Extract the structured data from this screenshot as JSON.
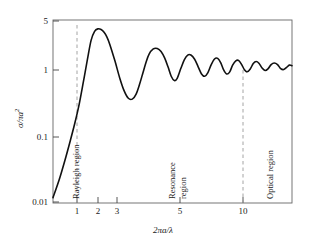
{
  "chart_data": {
    "type": "line",
    "title": "",
    "xlabel": "2πa/λ",
    "ylabel_parts": {
      "sigma": "σ/πa",
      "exponent": "2"
    },
    "ylabel": "σ/πa²",
    "xscale": "log",
    "yscale": "log",
    "xlim": [
      0.5,
      20
    ],
    "ylim": [
      0.01,
      5
    ],
    "grid": false,
    "legend": null,
    "xticks": [
      {
        "value": 1,
        "label": "1"
      },
      {
        "value": 2,
        "label": "2"
      },
      {
        "value": 3,
        "label": "3"
      },
      {
        "value": 5,
        "label": "5"
      },
      {
        "value": 10,
        "label": "10"
      }
    ],
    "yticks": [
      {
        "value": 5,
        "label": "5"
      },
      {
        "value": 1,
        "label": "1"
      },
      {
        "value": 0.1,
        "label": "0.1"
      },
      {
        "value": 0.01,
        "label": "0.01"
      }
    ],
    "annotations": [
      {
        "name": "rayleigh-region",
        "text": "Rayleigh region",
        "x": 0.82,
        "orientation": "vertical"
      },
      {
        "name": "resonance-region",
        "text": "Resonance",
        "text2": "region",
        "x": 4.0,
        "orientation": "vertical"
      },
      {
        "name": "optical-region",
        "text": "Optical region",
        "x": 12.5,
        "orientation": "vertical"
      }
    ],
    "reference_lines": [
      {
        "name": "rayleigh-resonance-boundary",
        "x": 1,
        "style": "dashed"
      },
      {
        "name": "resonance-optical-boundary",
        "x": 10,
        "style": "dashed"
      }
    ],
    "series": [
      {
        "name": "normalized radar cross section",
        "color": "#111111",
        "x": [
          0.5,
          0.55,
          0.6,
          0.65,
          0.7,
          0.75,
          0.8,
          0.85,
          0.9,
          0.95,
          1.0,
          1.05,
          1.1,
          1.15,
          1.2,
          1.3,
          1.4,
          1.5,
          1.6,
          1.7,
          1.8,
          1.9,
          2.0,
          2.1,
          2.2,
          2.35,
          2.5,
          2.65,
          2.8,
          2.95,
          3.1,
          3.25,
          3.4,
          3.6,
          3.8,
          4.0,
          4.2,
          4.45,
          4.7,
          4.95,
          5.2,
          5.45,
          5.75,
          6.05,
          6.35,
          6.65,
          6.95,
          7.3,
          7.65,
          8.0,
          8.4,
          8.8,
          9.2,
          9.6,
          10.0,
          10.5,
          11.0,
          11.5,
          12.0,
          12.6,
          13.2,
          13.8,
          14.5,
          15.2,
          16.0,
          16.8,
          17.6,
          18.4,
          19.2,
          20.0
        ],
        "y": [
          0.012,
          0.022,
          0.042,
          0.08,
          0.15,
          0.29,
          0.62,
          1.3,
          2.5,
          3.4,
          3.7,
          3.62,
          3.3,
          2.8,
          2.2,
          1.25,
          0.7,
          0.45,
          0.35,
          0.34,
          0.4,
          0.56,
          0.82,
          1.18,
          1.56,
          1.87,
          1.9,
          1.72,
          1.38,
          1.02,
          0.74,
          0.64,
          0.69,
          0.97,
          1.3,
          1.52,
          1.52,
          1.32,
          1.02,
          0.8,
          0.74,
          0.83,
          1.1,
          1.33,
          1.36,
          1.18,
          0.93,
          0.8,
          0.86,
          1.08,
          1.25,
          1.26,
          1.1,
          0.92,
          0.86,
          0.95,
          1.14,
          1.22,
          1.15,
          0.98,
          0.9,
          0.95,
          1.1,
          1.16,
          1.1,
          0.96,
          0.93,
          1.0,
          1.08,
          1.06
        ]
      }
    ]
  },
  "figure": {
    "frame_color": "#555555",
    "curve_color": "#111111",
    "dashed_color": "#999999"
  }
}
